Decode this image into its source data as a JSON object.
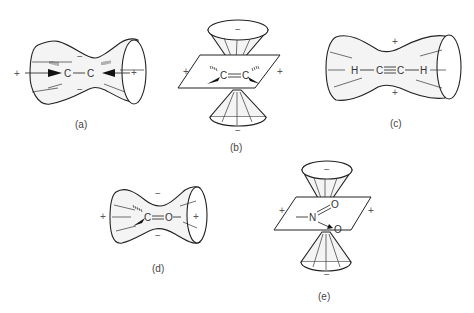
{
  "figure": {
    "panels": [
      {
        "id": "a",
        "caption": "(a)",
        "molecule": "C=C",
        "atoms": [
          "C",
          "C"
        ],
        "signs": {
          "top": "−",
          "bottom": "−",
          "left": "+",
          "right": "+"
        },
        "shape": "horizontal hourglass (double cone)"
      },
      {
        "id": "b",
        "caption": "(b)",
        "molecule": "C=C",
        "atoms": [
          "C",
          "C"
        ],
        "signs": {
          "top": "−",
          "bottom": "−",
          "left": "+",
          "right": "+"
        },
        "shape": "vertical double cone through plane"
      },
      {
        "id": "c",
        "caption": "(c)",
        "molecule": "H−C≡C−H",
        "atoms": [
          "H",
          "C",
          "C",
          "H"
        ],
        "signs": {
          "top": "+",
          "bottom": "+"
        },
        "shape": "horizontal hourglass (double cone)"
      },
      {
        "id": "d",
        "caption": "(d)",
        "molecule": "C=O",
        "atoms": [
          "C",
          "O"
        ],
        "signs": {
          "top": "−",
          "bottom": "−",
          "left": "+",
          "right": "+"
        },
        "shape": "horizontal hourglass (double cone)"
      },
      {
        "id": "e",
        "caption": "(e)",
        "molecule": "−N(=O)→O",
        "atoms": [
          "N",
          "O",
          "O"
        ],
        "signs": {
          "top": "−",
          "bottom": "−",
          "left": "+",
          "right": "+"
        },
        "shape": "vertical double cone through plane"
      }
    ],
    "symbols": {
      "plus": "+",
      "minus": "−"
    }
  }
}
